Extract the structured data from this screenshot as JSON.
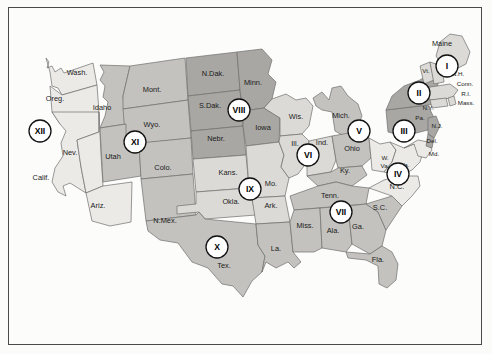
{
  "figure": {
    "kind": "us-circuit-map"
  },
  "palette": {
    "background": "#fbfbfa",
    "frame": "#4a4a4a",
    "shade_lightest": "#eceae7",
    "shade_light": "#dcdad6",
    "shade_medium": "#c3c2be",
    "shade_dark": "#a8a7a3",
    "border": "#6e6e6e",
    "label_text": "#1a1a1a",
    "badge_fill": "#ffffff",
    "badge_stroke": "#111111"
  },
  "circuits": [
    {
      "numeral": "I",
      "x": 447,
      "y": 66,
      "shade": "shade_light",
      "states": [
        "Maine",
        "Vt.",
        "N.H.",
        "Mass.",
        "R.I.",
        "Conn."
      ]
    },
    {
      "numeral": "II",
      "x": 419,
      "y": 93,
      "shade": "shade_dark",
      "states": [
        "N.Y."
      ]
    },
    {
      "numeral": "III",
      "x": 404,
      "y": 131,
      "shade": "shade_dark",
      "states": [
        "Pa.",
        "N.J.",
        "Del."
      ]
    },
    {
      "numeral": "IV",
      "x": 398,
      "y": 174,
      "shade": "shade_lightest",
      "states": [
        "Md.",
        "W.Va.",
        "Va.",
        "N.C."
      ]
    },
    {
      "numeral": "V",
      "x": 359,
      "y": 131,
      "shade": "shade_medium",
      "states": [
        "Mich.",
        "Ohio",
        "Ky."
      ]
    },
    {
      "numeral": "VI",
      "x": 308,
      "y": 155,
      "shade": "shade_light",
      "states": [
        "Wis.",
        "Ill.",
        "Ind."
      ]
    },
    {
      "numeral": "VII",
      "x": 341,
      "y": 212,
      "shade": "shade_medium",
      "states": [
        "Tenn.",
        "Miss.",
        "Ala.",
        "Ga.",
        "S.C.",
        "Fla."
      ]
    },
    {
      "numeral": "VIII",
      "x": 239,
      "y": 110,
      "shade": "shade_dark",
      "states": [
        "N.Dak.",
        "S.Dak.",
        "Minn.",
        "Nebr.",
        "Iowa"
      ]
    },
    {
      "numeral": "IX",
      "x": 250,
      "y": 189,
      "shade": "shade_light",
      "states": [
        "Kans.",
        "Mo.",
        "Okla.",
        "Ark."
      ]
    },
    {
      "numeral": "X",
      "x": 217,
      "y": 247,
      "shade": "shade_medium",
      "states": [
        "Tex.",
        "La."
      ]
    },
    {
      "numeral": "XI",
      "x": 135,
      "y": 142,
      "shade": "shade_medium",
      "states": [
        "Idaho",
        "Mont.",
        "Wyo.",
        "Utah",
        "Colo.",
        "N.Mex."
      ]
    },
    {
      "numeral": "XII",
      "x": 40,
      "y": 131,
      "shade": "shade_lightest",
      "states": [
        "Wash.",
        "Oreg.",
        "Calif.",
        "Nev.",
        "Ariz."
      ]
    }
  ],
  "state_labels": [
    {
      "name": "Wash.",
      "x": 77,
      "y": 75,
      "size": "normal"
    },
    {
      "name": "Oreg.",
      "x": 55,
      "y": 101,
      "size": "normal"
    },
    {
      "name": "Calif.",
      "x": 41,
      "y": 180,
      "size": "normal"
    },
    {
      "name": "Nev.",
      "x": 70,
      "y": 155,
      "size": "normal"
    },
    {
      "name": "Idaho",
      "x": 102,
      "y": 110,
      "size": "normal"
    },
    {
      "name": "Mont.",
      "x": 152,
      "y": 92,
      "size": "normal"
    },
    {
      "name": "Wyo.",
      "x": 152,
      "y": 127,
      "size": "normal"
    },
    {
      "name": "Utah",
      "x": 113,
      "y": 159,
      "size": "normal"
    },
    {
      "name": "Colo.",
      "x": 163,
      "y": 170,
      "size": "normal"
    },
    {
      "name": "Ariz.",
      "x": 98,
      "y": 208,
      "size": "normal"
    },
    {
      "name": "N.Mex.",
      "x": 165,
      "y": 223,
      "size": "normal"
    },
    {
      "name": "Tex.",
      "x": 224,
      "y": 268,
      "size": "normal"
    },
    {
      "name": "N.Dak.",
      "x": 213,
      "y": 76,
      "size": "normal"
    },
    {
      "name": "S.Dak.",
      "x": 210,
      "y": 108,
      "size": "normal"
    },
    {
      "name": "Nebr.",
      "x": 216,
      "y": 141,
      "size": "normal"
    },
    {
      "name": "Minn.",
      "x": 253,
      "y": 85,
      "size": "normal"
    },
    {
      "name": "Iowa",
      "x": 263,
      "y": 130,
      "size": "normal"
    },
    {
      "name": "Kans.",
      "x": 228,
      "y": 175,
      "size": "normal"
    },
    {
      "name": "Okla.",
      "x": 231,
      "y": 204,
      "size": "normal"
    },
    {
      "name": "Mo.",
      "x": 271,
      "y": 186,
      "size": "normal"
    },
    {
      "name": "Ark.",
      "x": 271,
      "y": 208,
      "size": "normal"
    },
    {
      "name": "La.",
      "x": 276,
      "y": 251,
      "size": "normal"
    },
    {
      "name": "Wis.",
      "x": 296,
      "y": 119,
      "size": "normal"
    },
    {
      "name": "Ill.",
      "x": 295,
      "y": 146,
      "size": "normal"
    },
    {
      "name": "Ind.",
      "x": 322,
      "y": 145,
      "size": "normal"
    },
    {
      "name": "Mich.",
      "x": 341,
      "y": 118,
      "size": "normal"
    },
    {
      "name": "Ohio",
      "x": 352,
      "y": 151,
      "size": "normal"
    },
    {
      "name": "Ky.",
      "x": 345,
      "y": 173,
      "size": "normal"
    },
    {
      "name": "Tenn.",
      "x": 330,
      "y": 198,
      "size": "normal"
    },
    {
      "name": "Miss.",
      "x": 305,
      "y": 228,
      "size": "normal"
    },
    {
      "name": "Ala.",
      "x": 333,
      "y": 233,
      "size": "normal"
    },
    {
      "name": "Ga.",
      "x": 358,
      "y": 229,
      "size": "normal"
    },
    {
      "name": "S.C.",
      "x": 380,
      "y": 210,
      "size": "normal"
    },
    {
      "name": "Fla.",
      "x": 378,
      "y": 262,
      "size": "normal"
    },
    {
      "name": "N.C.",
      "x": 397,
      "y": 189,
      "size": "normal"
    },
    {
      "name": "Va.",
      "x": 405,
      "y": 167,
      "size": "tiny"
    },
    {
      "name": "W.",
      "x": 385,
      "y": 160,
      "size": "tiny"
    },
    {
      "name": "Va.",
      "x": 385,
      "y": 168,
      "size": "tiny"
    },
    {
      "name": "Md.",
      "x": 434,
      "y": 156,
      "size": "tiny"
    },
    {
      "name": "Del.",
      "x": 432,
      "y": 143,
      "size": "tiny"
    },
    {
      "name": "N.J.",
      "x": 437,
      "y": 128,
      "size": "tiny"
    },
    {
      "name": "Pa.",
      "x": 420,
      "y": 120,
      "size": "tiny"
    },
    {
      "name": "N.Y.",
      "x": 428,
      "y": 110,
      "size": "tiny"
    },
    {
      "name": "Maine",
      "x": 442,
      "y": 46,
      "size": "normal"
    },
    {
      "name": "Vt.",
      "x": 426,
      "y": 73,
      "size": "tiny"
    },
    {
      "name": "N.H.",
      "x": 458,
      "y": 76,
      "size": "tiny"
    },
    {
      "name": "Conn.",
      "x": 465,
      "y": 86,
      "size": "tiny"
    },
    {
      "name": "R.I.",
      "x": 466,
      "y": 96,
      "size": "tiny"
    },
    {
      "name": "Mass.",
      "x": 466,
      "y": 105,
      "size": "tiny"
    }
  ]
}
